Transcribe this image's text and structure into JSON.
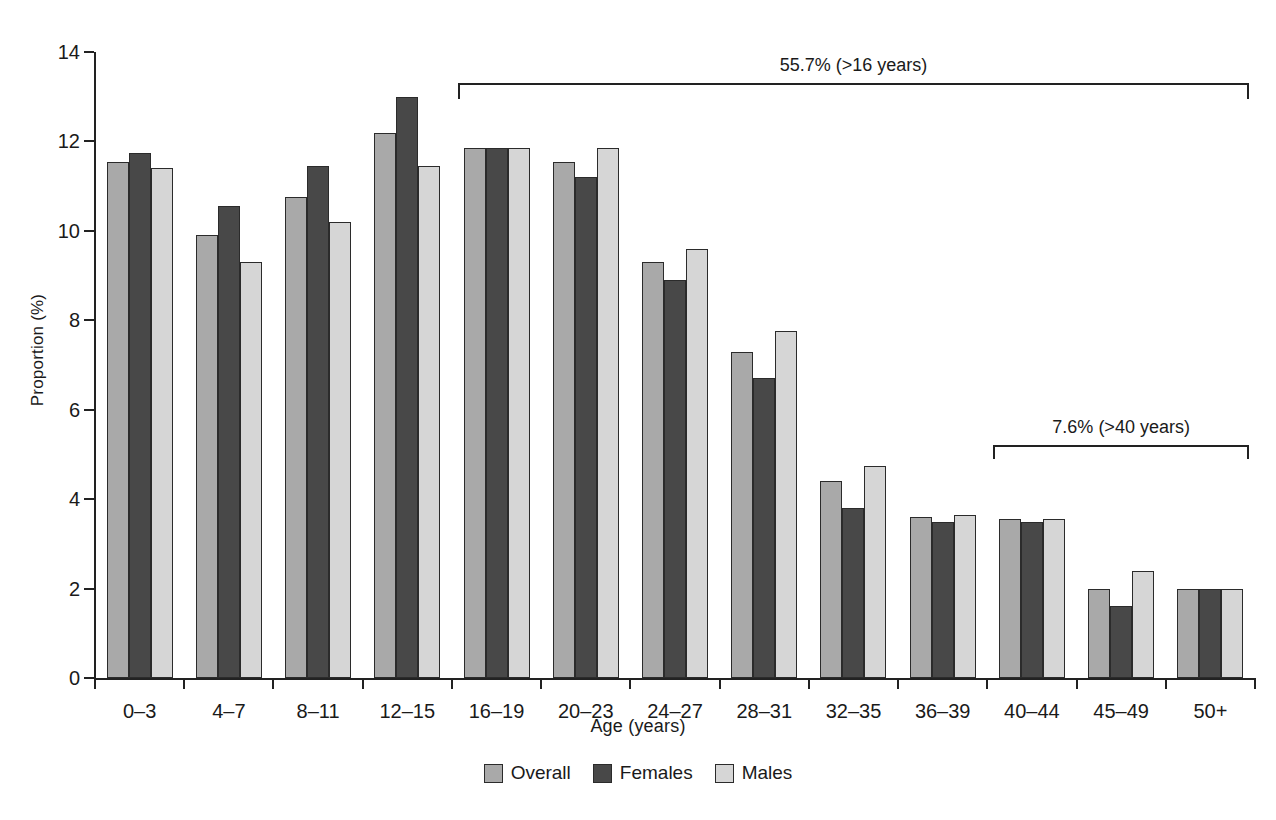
{
  "chart_data": {
    "type": "bar",
    "title": "",
    "xlabel": "Age (years)",
    "ylabel": "Proportion (%)",
    "ylim": [
      0,
      14
    ],
    "yticks": [
      0,
      2,
      4,
      6,
      8,
      10,
      12,
      14
    ],
    "ytick_labels": [
      "0",
      "2",
      "4",
      "6",
      "8",
      "10",
      "12",
      "14"
    ],
    "grid": false,
    "legend_position": "bottom-center",
    "categories": [
      "0–3",
      "4–7",
      "8–11",
      "12–15",
      "16–19",
      "20–23",
      "24–27",
      "28–31",
      "32–35",
      "36–39",
      "40–44",
      "45–49",
      "50+"
    ],
    "series": [
      {
        "name": "Overall",
        "color": "#a9a9a9",
        "values": [
          11.55,
          9.9,
          10.75,
          12.2,
          11.85,
          11.55,
          9.3,
          7.3,
          4.4,
          3.6,
          3.55,
          2.0,
          2.0
        ]
      },
      {
        "name": "Females",
        "color": "#484848",
        "values": [
          11.75,
          10.55,
          11.45,
          13.0,
          11.85,
          11.2,
          8.9,
          6.7,
          3.8,
          3.5,
          3.5,
          1.6,
          2.0
        ]
      },
      {
        "name": "Males",
        "color": "#d6d6d6",
        "values": [
          11.4,
          9.3,
          10.2,
          11.45,
          11.85,
          11.85,
          9.6,
          7.75,
          4.75,
          3.65,
          3.55,
          2.4,
          2.0
        ]
      }
    ],
    "annotations": [
      {
        "label": "55.7% (>16 years)",
        "start_category": "16–19",
        "end_category": "50+",
        "bracket_top_value": 13.3,
        "bracket_depth_value": 0.35
      },
      {
        "label": "7.6% (>40 years)",
        "start_category": "40–44",
        "end_category": "50+",
        "bracket_top_value": 5.2,
        "bracket_depth_value": 0.3
      }
    ]
  },
  "legend": {
    "items": [
      {
        "label": "Overall",
        "color": "#a9a9a9"
      },
      {
        "label": "Females",
        "color": "#484848"
      },
      {
        "label": "Males",
        "color": "#d6d6d6"
      }
    ]
  }
}
